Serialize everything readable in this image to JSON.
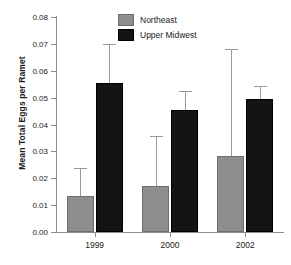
{
  "chart_data": {
    "type": "bar",
    "title": "",
    "subtitle": "",
    "xlabel": "",
    "ylabel": "Mean Total Eggs per Ramet",
    "categories": [
      "1999",
      "2000",
      "2002"
    ],
    "ylim": [
      0.0,
      0.08
    ],
    "ytick_values": [
      0.0,
      0.01,
      0.02,
      0.03,
      0.04,
      0.05,
      0.06,
      0.07,
      0.08
    ],
    "ytick_labels": [
      "0.00",
      "0.01",
      "0.02",
      "0.03",
      "0.04",
      "0.05",
      "0.06",
      "0.07",
      "0.08"
    ],
    "grid": false,
    "legend_position": "top-center",
    "error_bar_style": "upper-only",
    "series": [
      {
        "name": "Northeast",
        "color": "#8e8e8e",
        "values": [
          0.0134,
          0.0171,
          0.0283
        ],
        "error_upper": [
          0.024,
          0.0357,
          0.068
        ]
      },
      {
        "name": "Upper Midwest",
        "color": "#141414",
        "values": [
          0.0555,
          0.0453,
          0.0495
        ],
        "error_upper": [
          0.07,
          0.0525,
          0.0543
        ]
      }
    ]
  },
  "legend": {
    "items": [
      {
        "label": "Northeast",
        "swatch": "northeast"
      },
      {
        "label": "Upper Midwest",
        "swatch": "midwest"
      }
    ]
  },
  "axes": {
    "y_title": "Mean Total Eggs per Ramet"
  }
}
